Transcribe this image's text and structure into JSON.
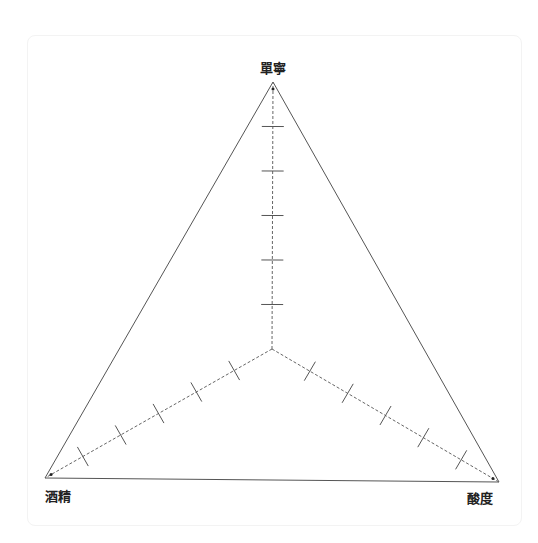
{
  "chart_data": {
    "type": "radar",
    "title": "",
    "axes": [
      "單寧",
      "酸度",
      "酒精"
    ],
    "axis_order_note": "top, bottom-right, bottom-left",
    "ticks_per_axis": 5,
    "range": [
      0,
      6
    ],
    "series": [],
    "grid": "axes-only",
    "outline": "triangle",
    "legend": "none"
  },
  "colors": {
    "outline": "#555555",
    "axis": "#666666",
    "tick": "#555555",
    "label": "#222222"
  }
}
